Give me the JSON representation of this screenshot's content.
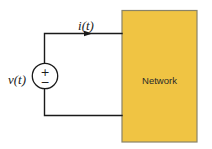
{
  "diagram": {
    "current_label": "i(t)",
    "voltage_label": "v(t)",
    "network_label": "Network",
    "source_plus_symbol": "+",
    "source_minus_symbol": "−"
  },
  "colors": {
    "background": "#FFFFFF",
    "network_fill": "#F0C443",
    "network_border": "#8A8468",
    "wire": "#1A1A1A",
    "text": "#1A1A1A"
  }
}
